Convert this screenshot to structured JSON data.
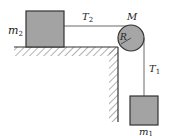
{
  "diagram": {
    "labels": {
      "m2": "m",
      "m2_sub": "2",
      "T2": "T",
      "T2_sub": "2",
      "M": "M",
      "R": "R",
      "T1": "T",
      "T1_sub": "1",
      "m1": "m",
      "m1_sub": "1"
    },
    "colors": {
      "block_fill": "#a3a3a3",
      "pulley_fill": "#a6a6a6",
      "stroke": "#333333",
      "hatch": "#555555",
      "background": "#ffffff"
    }
  }
}
